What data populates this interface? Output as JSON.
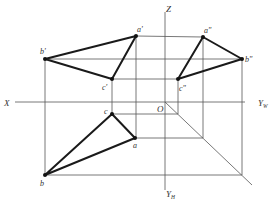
{
  "diagram": {
    "axes": {
      "x_label": "X",
      "z_label": "Z",
      "origin_label": "O",
      "yw_label": "Y",
      "yw_sub": "W",
      "yh_label": "Y",
      "yh_sub": "H"
    },
    "front_view": {
      "a": {
        "label": "a'",
        "x": 136,
        "y": 36
      },
      "b": {
        "label": "b'",
        "x": 45,
        "y": 59
      },
      "c": {
        "label": "c'",
        "x": 112,
        "y": 79
      }
    },
    "side_view": {
      "a": {
        "label": "a\"",
        "x": 203,
        "y": 37
      },
      "b": {
        "label": "b\"",
        "x": 242,
        "y": 59
      },
      "c": {
        "label": "c\"",
        "x": 178,
        "y": 79
      }
    },
    "top_view": {
      "a": {
        "label": "a",
        "x": 135,
        "y": 138
      },
      "b": {
        "label": "b",
        "x": 45,
        "y": 175
      },
      "c": {
        "label": "c",
        "x": 112,
        "y": 114
      }
    },
    "colors": {
      "line": "#1a1a1a",
      "projection": "#555555",
      "background": "#ffffff"
    }
  }
}
